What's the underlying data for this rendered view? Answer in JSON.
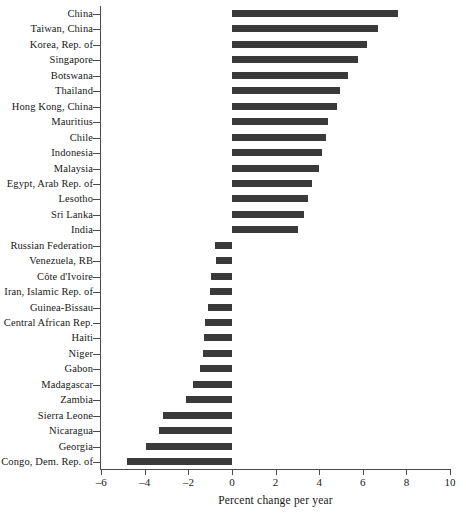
{
  "chart_data": {
    "type": "bar",
    "orientation": "horizontal",
    "title": "",
    "xlabel": "Percent change per year",
    "ylabel": "",
    "xlim": [
      -6,
      10
    ],
    "xticks": [
      -6,
      -4,
      -2,
      0,
      2,
      4,
      6,
      8,
      10
    ],
    "xtick_labels": [
      "–6",
      "–4",
      "–2",
      "0",
      "2",
      "4",
      "6",
      "8",
      "10"
    ],
    "grid": false,
    "legend": null,
    "categories": [
      "China",
      "Taiwan, China",
      "Korea, Rep. of",
      "Singapore",
      "Botswana",
      "Thailand",
      "Hong Kong, China",
      "Mauritius",
      "Chile",
      "Indonesia",
      "Malaysia",
      "Egypt, Arab Rep. of",
      "Lesotho",
      "Sri Lanka",
      "India",
      "Russian Federation",
      "Venezuela, RB",
      "Côte d'Ivoire",
      "Iran, Islamic Rep. of",
      "Guinea-Bissau",
      "Central African Rep.",
      "Haiti",
      "Niger",
      "Gabon",
      "Madagascar",
      "Zambia",
      "Sierra Leone",
      "Nicaragua",
      "Georgia",
      "Congo, Dem. Rep. of"
    ],
    "values": [
      7.6,
      6.7,
      6.2,
      5.8,
      5.3,
      4.95,
      4.8,
      4.4,
      4.3,
      4.15,
      4.0,
      3.65,
      3.5,
      3.3,
      3.05,
      -0.8,
      -0.75,
      -0.95,
      -1.0,
      -1.1,
      -1.25,
      -1.3,
      -1.35,
      -1.45,
      -1.8,
      -2.1,
      -3.15,
      -3.35,
      -3.95,
      -4.8
    ],
    "bar_color": "#3a3a3a",
    "axis_color": "#4a4a4a"
  }
}
